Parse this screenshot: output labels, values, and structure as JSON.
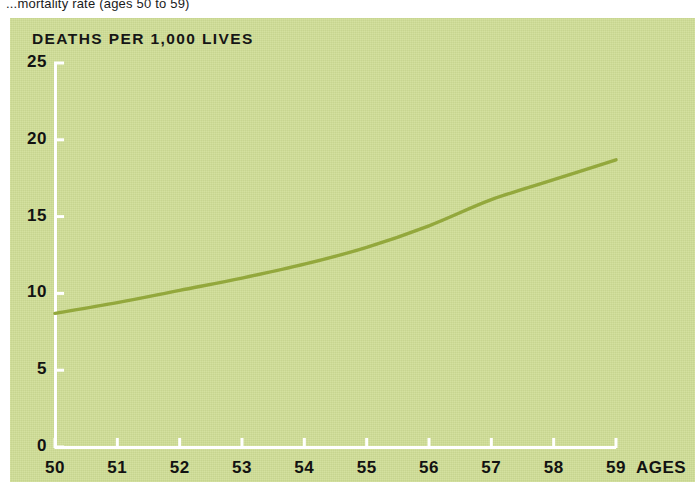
{
  "caption": {
    "text": "...mortality rate (ages 50 to 59)"
  },
  "colors": {
    "panel_background": "#cfdd95",
    "curve": "#93a83c",
    "axis_line": "#ffffff",
    "text": "#121212"
  },
  "chart_data": {
    "type": "line",
    "title": "",
    "ylabel": "DEATHS PER 1,000 LIVES",
    "xlabel": "AGES",
    "xlim": [
      50,
      59
    ],
    "ylim": [
      0,
      25
    ],
    "grid": false,
    "legend": null,
    "y_ticks": [
      "0",
      "5",
      "10",
      "15",
      "20",
      "25"
    ],
    "y_tick_values": [
      0,
      5,
      10,
      15,
      20,
      25
    ],
    "x_ticks": [
      "50",
      "51",
      "52",
      "53",
      "54",
      "55",
      "56",
      "57",
      "58",
      "59"
    ],
    "x_tick_values": [
      50,
      51,
      52,
      53,
      54,
      55,
      56,
      57,
      58,
      59
    ],
    "x": [
      50,
      51,
      52,
      53,
      54,
      55,
      56,
      57,
      58,
      59
    ],
    "values": [
      8.7,
      9.4,
      10.2,
      11.0,
      11.9,
      13.0,
      14.4,
      16.1,
      17.4,
      18.7
    ],
    "series": [
      {
        "name": "Deaths per 1,000 lives",
        "values": [
          8.7,
          9.4,
          10.2,
          11.0,
          11.9,
          13.0,
          14.4,
          16.1,
          17.4,
          18.7
        ]
      }
    ]
  }
}
